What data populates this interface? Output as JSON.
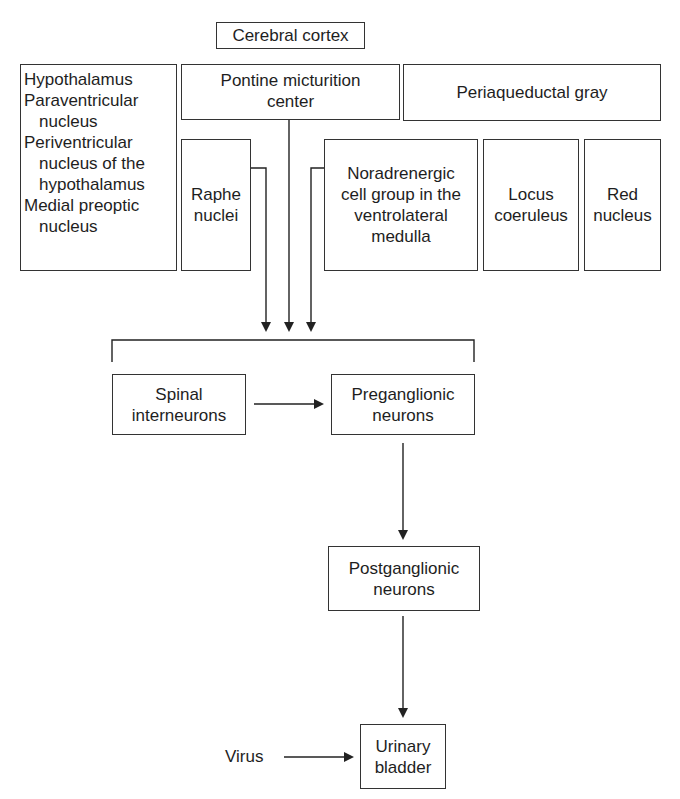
{
  "diagram": {
    "top": {
      "cerebral_cortex": "Cerebral cortex"
    },
    "row1": {
      "hypothalamus_lines": [
        {
          "text": "Hypothalamus",
          "indent": false
        },
        {
          "text": "Paraventricular",
          "indent": false
        },
        {
          "text": "nucleus",
          "indent": true
        },
        {
          "text": "Periventricular",
          "indent": false
        },
        {
          "text": "nucleus of the",
          "indent": true
        },
        {
          "text": "hypothalamus",
          "indent": true
        },
        {
          "text": "Medial preoptic",
          "indent": false
        },
        {
          "text": "nucleus",
          "indent": true
        }
      ],
      "pontine": "Pontine micturition\ncenter",
      "periaqueductal": "Periaqueductal gray"
    },
    "row2": {
      "raphe": "Raphe\nnuclei",
      "noradrenergic": "Noradrenergic\ncell group in the\nventrolateral\nmedulla",
      "locus": "Locus\ncoeruleus",
      "red": "Red\nnucleus"
    },
    "spinal": {
      "interneurons": "Spinal\ninterneurons",
      "preganglionic": "Preganglionic\nneurons"
    },
    "postganglionic": "Postganglionic\nneurons",
    "bladder": "Urinary\nbladder",
    "virus": "Virus",
    "line_color": "#222222"
  }
}
